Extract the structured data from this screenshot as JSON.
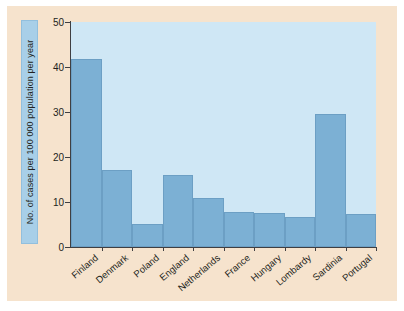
{
  "figure": {
    "panel_bg": "#f6e3cd",
    "plot_bg": "#cfe7f5",
    "bar_color": "#7cb0d4",
    "axis_color": "#3f3f42",
    "label_plate_color": "#a8cfe8"
  },
  "chart_data": {
    "type": "bar",
    "title": "",
    "xlabel": "",
    "ylabel": "No. of cases per 100 000 population per year",
    "ylim": [
      0,
      50
    ],
    "yticks": [
      0,
      10,
      20,
      30,
      40,
      50
    ],
    "ytick_labels": [
      "0",
      "10",
      "20",
      "30",
      "40",
      "50"
    ],
    "grid": false,
    "legend": "none",
    "categories": [
      "Finland",
      "Denmark",
      "Poland",
      "England",
      "Netherlands",
      "France",
      "Hungary",
      "Lombardy",
      "Sardinia",
      "Portugal"
    ],
    "values": [
      41.8,
      17.1,
      5.1,
      16.0,
      10.8,
      7.7,
      7.5,
      6.6,
      29.6,
      7.3
    ]
  }
}
